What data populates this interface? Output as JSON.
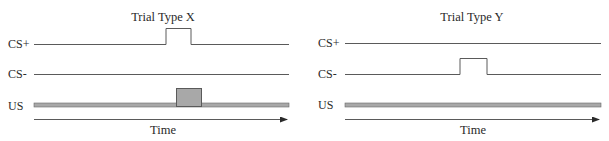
{
  "panels": [
    {
      "title": "Trial Type X",
      "signals": [
        {
          "label": "CS+",
          "pulse": true
        },
        {
          "label": "CS-",
          "pulse": false
        },
        {
          "label": "US",
          "pulse": true
        }
      ],
      "axis_label": "Time"
    },
    {
      "title": "Trial Type Y",
      "signals": [
        {
          "label": "CS+",
          "pulse": false
        },
        {
          "label": "CS-",
          "pulse": true
        },
        {
          "label": "US",
          "pulse": false
        }
      ],
      "axis_label": "Time"
    }
  ],
  "colors": {
    "line": "#5a5a5a",
    "us_fill": "#a8a8a8",
    "text": "#2a2a2a"
  }
}
